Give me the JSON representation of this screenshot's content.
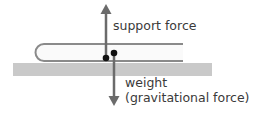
{
  "diagram": {
    "labels": {
      "support": "support force",
      "weight": "weight",
      "weight_sub": "(gravitational force)"
    },
    "colors": {
      "arrow": "#6b6b6b",
      "table": "#c8c8c8",
      "book_outline": "#8a8a8a",
      "dot": "#111111",
      "text": "#3a3a3a"
    }
  }
}
